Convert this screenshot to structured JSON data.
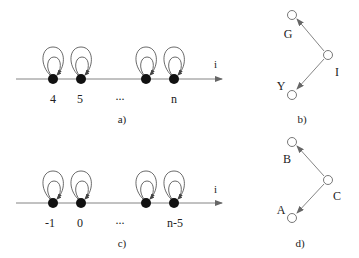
{
  "panels": {
    "a": {
      "caption": "a)",
      "axis_label": "i",
      "node_labels": [
        "4",
        "5",
        "...",
        "n"
      ]
    },
    "b": {
      "caption": "b)",
      "nodes": {
        "top": "G",
        "right": "I",
        "bottom": "Y"
      }
    },
    "c": {
      "caption": "c)",
      "axis_label": "i",
      "node_labels": [
        "-1",
        "0",
        "...",
        "n-5"
      ]
    },
    "d": {
      "caption": "d)",
      "nodes": {
        "top": "B",
        "right": "C",
        "bottom": "A"
      }
    }
  },
  "colors": {
    "line": "#555555",
    "node_fill": "#111111",
    "text": "#222222"
  }
}
